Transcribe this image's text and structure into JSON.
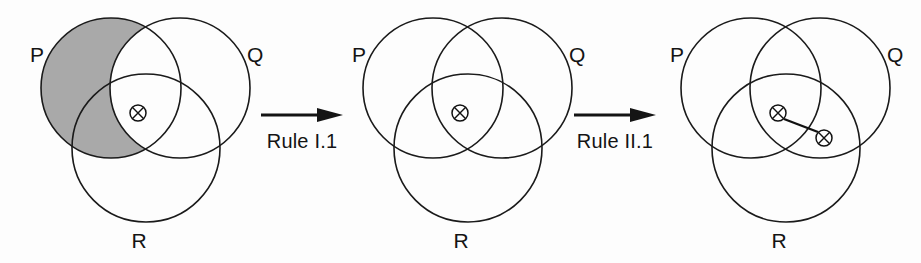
{
  "figure": {
    "caption": "",
    "background_color": "#fdfdfd",
    "stroke_color": "#1a1a1a",
    "shade_color": "#a9a9a9",
    "panel_count": 3
  },
  "labels": {
    "p": "P",
    "q": "Q",
    "r": "R"
  },
  "transitions": [
    {
      "id": "rule-1",
      "label": "Rule I.1",
      "arrow": "right-arrow-icon"
    },
    {
      "id": "rule-2",
      "label": "Rule II.1",
      "arrow": "right-arrow-icon"
    }
  ],
  "panels": [
    {
      "id": "panel-1",
      "index": 1,
      "labels": {
        "p": "P",
        "q": "Q",
        "r": "R"
      },
      "shaded_region": "P-minus-Q",
      "shaded_region_description": "region of P outside Q (includes P-and-R-not-Q)",
      "shade_color": "#a9a9a9",
      "x_marks": [
        {
          "id": "x-center",
          "region": "P-and-Q-and-R",
          "cx": 130,
          "cy": 113,
          "r": 8
        }
      ],
      "links": []
    },
    {
      "id": "panel-2",
      "index": 2,
      "labels": {
        "p": "P",
        "q": "Q",
        "r": "R"
      },
      "shaded_region": "none",
      "shaded_region_description": "no shading",
      "shade_color": "#a9a9a9",
      "x_marks": [
        {
          "id": "x-center",
          "region": "P-and-Q-and-R",
          "cx": 130,
          "cy": 113,
          "r": 8
        }
      ],
      "links": []
    },
    {
      "id": "panel-3",
      "index": 3,
      "labels": {
        "p": "P",
        "q": "Q",
        "r": "R"
      },
      "shaded_region": "none",
      "shaded_region_description": "no shading",
      "shade_color": "#a9a9a9",
      "x_marks": [
        {
          "id": "x-center",
          "region": "P-and-Q-and-R",
          "cx": 130,
          "cy": 113,
          "r": 8
        },
        {
          "id": "x-qr",
          "region": "Q-and-R-not-P",
          "cx": 176,
          "cy": 138,
          "r": 8
        }
      ],
      "links": [
        {
          "id": "link-center-qr",
          "from": "x-center",
          "to": "x-qr"
        }
      ]
    }
  ],
  "geometry": {
    "circle_p": {
      "cx": 103,
      "cy": 88,
      "r": 70
    },
    "circle_q": {
      "cx": 172,
      "cy": 88,
      "r": 70
    },
    "circle_r": {
      "cx": 138,
      "cy": 148,
      "r": 74
    },
    "label_p": {
      "x": 22,
      "y": 62
    },
    "label_q": {
      "x": 239,
      "y": 62
    },
    "label_r": {
      "x": 131,
      "y": 248
    }
  }
}
